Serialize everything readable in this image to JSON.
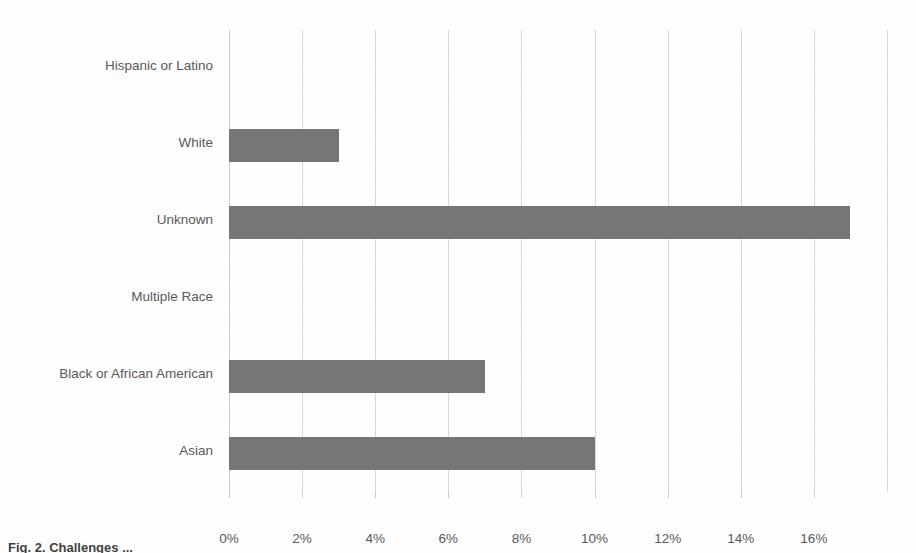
{
  "chart_data": {
    "type": "bar",
    "orientation": "horizontal",
    "title": "",
    "xlabel": "",
    "ylabel": "",
    "categories": [
      "Hispanic or Latino",
      "White",
      "Unknown",
      "Multiple Race",
      "Black or African American",
      "Asian"
    ],
    "values": [
      0,
      3,
      17,
      0,
      7,
      10
    ],
    "value_unit": "%",
    "xlim": [
      0,
      18
    ],
    "xticks": [
      0,
      2,
      4,
      6,
      8,
      10,
      12,
      14,
      16
    ],
    "xtick_labels": [
      "0%",
      "2%",
      "4%",
      "6%",
      "8%",
      "10%",
      "12%",
      "14%",
      "16%"
    ],
    "grid": "vertical",
    "legend": "none",
    "series": [
      {
        "name": "Percent",
        "color": "#767676",
        "values": [
          0,
          3,
          17,
          0,
          7,
          10
        ]
      }
    ]
  },
  "axis": {
    "gridline_color": "#d9d9d9",
    "label_color": "#595959",
    "unlabeled_gridlines": [
      18
    ]
  },
  "caption": {
    "text": "Fig. 2. Challenges ..."
  }
}
